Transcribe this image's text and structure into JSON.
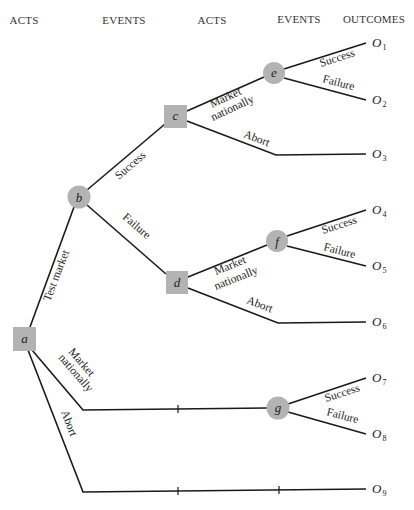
{
  "headers": [
    "ACTS",
    "EVENTS",
    "ACTS",
    "EVENTS",
    "OUTCOMES"
  ],
  "nodes": {
    "a": {
      "label": "a",
      "type": "decision"
    },
    "b": {
      "label": "b",
      "type": "chance"
    },
    "c": {
      "label": "c",
      "type": "decision"
    },
    "d": {
      "label": "d",
      "type": "decision"
    },
    "e": {
      "label": "e",
      "type": "chance"
    },
    "f": {
      "label": "f",
      "type": "chance"
    },
    "g": {
      "label": "g",
      "type": "chance"
    }
  },
  "edges": {
    "a_b": "Test market",
    "a_g_line1": "Market",
    "a_g_line2": "nationally",
    "a_o9": "Abort",
    "b_c": "Success",
    "b_d": "Failure",
    "c_e_line1": "Market",
    "c_e_line2": "nationally",
    "c_o3": "Abort",
    "d_f_line1": "Market",
    "d_f_line2": "nationally",
    "d_o6": "Abort",
    "e_o1": "Success",
    "e_o2": "Failure",
    "f_o4": "Success",
    "f_o5": "Failure",
    "g_o7": "Success",
    "g_o8": "Failure"
  },
  "outcomes": [
    {
      "letter": "O",
      "sub": "1"
    },
    {
      "letter": "O",
      "sub": "2"
    },
    {
      "letter": "O",
      "sub": "3"
    },
    {
      "letter": "O",
      "sub": "4"
    },
    {
      "letter": "O",
      "sub": "5"
    },
    {
      "letter": "O",
      "sub": "6"
    },
    {
      "letter": "O",
      "sub": "7"
    },
    {
      "letter": "O",
      "sub": "8"
    },
    {
      "letter": "O",
      "sub": "9"
    }
  ],
  "colors": {
    "node_fill": "#b3b3b3",
    "line": "#1a1a1a"
  }
}
